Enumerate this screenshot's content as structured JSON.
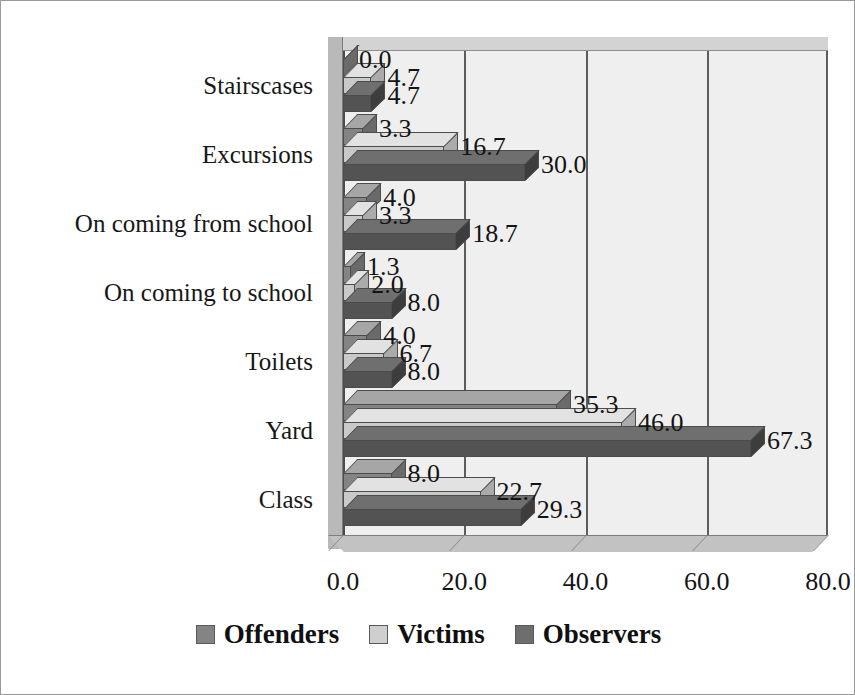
{
  "chart_data": {
    "type": "bar",
    "orientation": "horizontal",
    "title": "",
    "subtitle": "",
    "xlabel": "",
    "ylabel": "",
    "xlim": [
      0,
      80
    ],
    "ylim": null,
    "grid": true,
    "grid_axis": "x",
    "legend_position": "bottom",
    "style": "3d-clustered-horizontal-bar",
    "categories": [
      "Stairscases",
      "Excursions",
      "On coming from school",
      "On coming to school",
      "Toilets",
      "Yard",
      "Class"
    ],
    "series": [
      {
        "name": "Offenders",
        "color": "#848484",
        "values": [
          0.0,
          3.3,
          4.0,
          1.3,
          4.0,
          35.3,
          8.0
        ],
        "labels": [
          "0.0",
          "3.3",
          "4.0",
          "1.3",
          "4.0",
          "35.3",
          "8.0"
        ]
      },
      {
        "name": "Victims",
        "color": "#c9c9c9",
        "values": [
          4.7,
          16.7,
          3.3,
          2.0,
          6.7,
          46.0,
          22.7
        ],
        "labels": [
          "4.7",
          "16.7",
          "3.3",
          "2.0",
          "6.7",
          "46.0",
          "22.7"
        ]
      },
      {
        "name": "Observers",
        "color": "#535353",
        "values": [
          4.7,
          30.0,
          18.7,
          8.0,
          8.0,
          67.3,
          29.3
        ],
        "labels": [
          "4.7",
          "30.0",
          "18.7",
          "8.0",
          "8.0",
          "67.3",
          "29.3"
        ]
      }
    ],
    "xticks": [
      0,
      20,
      40,
      60,
      80
    ],
    "xtick_labels": [
      "0.0",
      "20.0",
      "40.0",
      "60.0",
      "80.0"
    ]
  },
  "legend": {
    "items": [
      {
        "label": "Offenders",
        "color": "#848484"
      },
      {
        "label": "Victims",
        "color": "#c9c9c9"
      },
      {
        "label": "Observers",
        "color": "#6e6e6e"
      }
    ]
  }
}
